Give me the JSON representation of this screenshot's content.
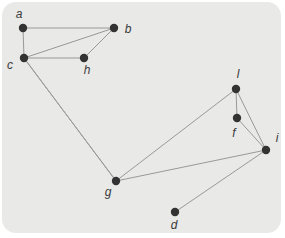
{
  "figure": {
    "type": "undirected-graph-diagram",
    "page_background": "#ffffff",
    "panel_background": "#e9e9e7",
    "node_color": "#333333",
    "edge_color": "#999999",
    "label_color": "#3a3a3a",
    "node_radius": 4.2,
    "edge_width": 1
  },
  "graph": {
    "nodes": [
      {
        "id": "a",
        "label": "a",
        "x": 23,
        "y": 28,
        "lx": 19,
        "ly": 14
      },
      {
        "id": "b",
        "label": "b",
        "x": 114,
        "y": 28,
        "lx": 128,
        "ly": 29
      },
      {
        "id": "c",
        "label": "c",
        "x": 24,
        "y": 58,
        "lx": 10,
        "ly": 65
      },
      {
        "id": "h",
        "label": "h",
        "x": 84,
        "y": 58,
        "lx": 87,
        "ly": 70
      },
      {
        "id": "l",
        "label": "l",
        "x": 236,
        "y": 89,
        "lx": 238,
        "ly": 74
      },
      {
        "id": "f",
        "label": "f",
        "x": 237,
        "y": 118,
        "lx": 234,
        "ly": 133
      },
      {
        "id": "i",
        "label": "i",
        "x": 266,
        "y": 150,
        "lx": 277,
        "ly": 138
      },
      {
        "id": "g",
        "label": "g",
        "x": 116,
        "y": 181,
        "lx": 108,
        "ly": 192
      },
      {
        "id": "d",
        "label": "d",
        "x": 175,
        "y": 212,
        "lx": 174,
        "ly": 225
      }
    ],
    "edges": [
      [
        "a",
        "b"
      ],
      [
        "a",
        "c"
      ],
      [
        "b",
        "c"
      ],
      [
        "b",
        "h"
      ],
      [
        "c",
        "h"
      ],
      [
        "c",
        "g"
      ],
      [
        "c",
        "g"
      ],
      [
        "g",
        "l"
      ],
      [
        "g",
        "i"
      ],
      [
        "l",
        "f"
      ],
      [
        "l",
        "i"
      ],
      [
        "f",
        "i"
      ],
      [
        "i",
        "d"
      ]
    ]
  }
}
